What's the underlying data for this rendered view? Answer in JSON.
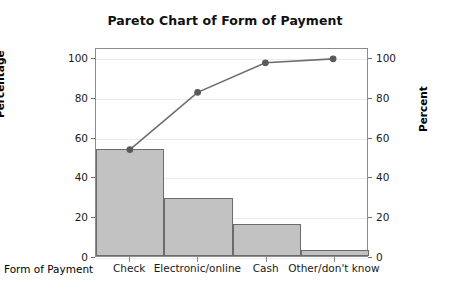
{
  "chart_data": {
    "type": "bar",
    "title": "Pareto Chart of Form of Payment",
    "xlabel": "Form of Payment",
    "ylabel": "Percentage",
    "y2label": "Percent",
    "categories": [
      "Check",
      "Electronic/online",
      "Cash",
      "Other/don't know"
    ],
    "values": [
      54,
      29,
      16,
      3
    ],
    "series": [
      {
        "name": "Percentage",
        "type": "bar",
        "values": [
          54,
          29,
          16,
          3
        ]
      },
      {
        "name": "Cumulative Percent",
        "type": "line",
        "values": [
          54,
          83,
          98,
          100
        ]
      }
    ],
    "ylim": [
      0,
      105
    ],
    "y2lim": [
      0,
      105
    ],
    "yticks": [
      0,
      20,
      40,
      60,
      80,
      100
    ],
    "y2ticks": [
      0,
      20,
      40,
      60,
      80,
      100
    ],
    "grid": true,
    "legend": "none",
    "colors": {
      "bar_fill": "#c2c2c2",
      "bar_edge": "#6b6b6b",
      "line": "#6e6e6e",
      "marker": "#5a5a5a",
      "grid": "#ebebeb",
      "frame": "#8c8c8c",
      "text": "#000000",
      "background": "#ffffff"
    }
  }
}
